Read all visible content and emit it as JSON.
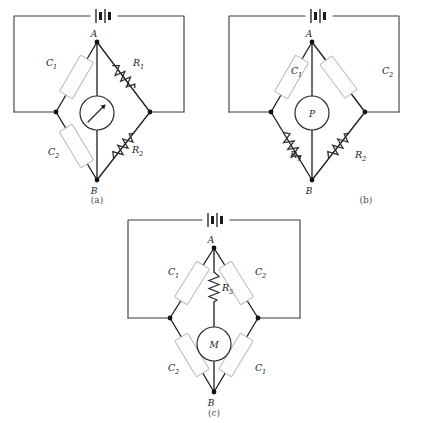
{
  "figure": {
    "background_color": "#ffffff",
    "wire_color": "#3a3a3a",
    "capacitor_fill": "#fdfdfd",
    "capacitor_stroke": "#b9b9b9",
    "label_color": "#1a1a1a",
    "caption_color": "#4a4a4a"
  },
  "panels": [
    {
      "id": "a",
      "caption": "(a)",
      "node_top": "A",
      "node_bottom": "B",
      "meter": {
        "type": "galvanometer",
        "label": "",
        "has_needle": true
      },
      "source": {
        "type": "battery",
        "label": ""
      },
      "arms": [
        {
          "position": "upper-left",
          "component": "capacitor",
          "symbol": "C",
          "subscript": "1",
          "label": "C₁"
        },
        {
          "position": "upper-right",
          "component": "resistor",
          "symbol": "R",
          "subscript": "1",
          "label": "R₁"
        },
        {
          "position": "lower-left",
          "component": "capacitor",
          "symbol": "C",
          "subscript": "2",
          "label": "C₂"
        },
        {
          "position": "lower-right",
          "component": "resistor",
          "symbol": "R",
          "subscript": "2",
          "label": "R₂"
        }
      ],
      "labels": {
        "upper_left": "C",
        "upper_left_sub": "1",
        "upper_right": "R",
        "upper_right_sub": "1",
        "lower_left": "C",
        "lower_left_sub": "2",
        "lower_right": "R",
        "lower_right_sub": "2"
      }
    },
    {
      "id": "b",
      "caption": "(b)",
      "node_top": "A",
      "node_bottom": "B",
      "meter": {
        "type": "meter",
        "label": "P",
        "has_needle": false
      },
      "source": {
        "type": "battery",
        "label": ""
      },
      "arms": [
        {
          "position": "upper-left",
          "component": "capacitor",
          "symbol": "C",
          "subscript": "1",
          "label": "C₁"
        },
        {
          "position": "upper-right",
          "component": "capacitor",
          "symbol": "C",
          "subscript": "2",
          "label": "C₂"
        },
        {
          "position": "lower-left",
          "component": "resistor",
          "symbol": "R",
          "subscript": "1",
          "label": "R₁"
        },
        {
          "position": "lower-right",
          "component": "resistor",
          "symbol": "R",
          "subscript": "2",
          "label": "R₂"
        }
      ],
      "labels": {
        "upper_left": "C",
        "upper_left_sub": "1",
        "upper_right": "C",
        "upper_right_sub": "2",
        "lower_left": "R",
        "lower_left_sub": "1",
        "lower_right": "R",
        "lower_right_sub": "2"
      }
    },
    {
      "id": "c",
      "caption": "(c)",
      "node_top": "A",
      "node_bottom": "B",
      "meter": {
        "type": "meter",
        "label": "M",
        "has_needle": false
      },
      "center_resistor": {
        "symbol": "R",
        "subscript": "5",
        "label": "R₅"
      },
      "source": {
        "type": "battery",
        "label": ""
      },
      "arms": [
        {
          "position": "upper-left",
          "component": "capacitor",
          "symbol": "C",
          "subscript": "1",
          "label": "C₁"
        },
        {
          "position": "upper-right",
          "component": "capacitor",
          "symbol": "C",
          "subscript": "2",
          "label": "C₂"
        },
        {
          "position": "lower-left",
          "component": "capacitor",
          "symbol": "C",
          "subscript": "2",
          "label": "C₂"
        },
        {
          "position": "lower-right",
          "component": "capacitor",
          "symbol": "C",
          "subscript": "1",
          "label": "C₁"
        }
      ],
      "labels": {
        "upper_left": "C",
        "upper_left_sub": "1",
        "upper_right": "C",
        "upper_right_sub": "2",
        "lower_left": "C",
        "lower_left_sub": "2",
        "lower_right": "C",
        "lower_right_sub": "1",
        "center_res": "R",
        "center_res_sub": "5"
      }
    }
  ]
}
